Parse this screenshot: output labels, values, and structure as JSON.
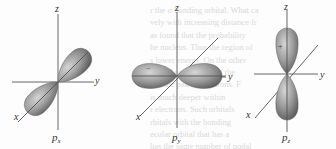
{
  "figure": {
    "orbitals": [
      {
        "name": "px",
        "label_main": "p",
        "label_sub": "x",
        "axes": [
          "z",
          "y",
          "x"
        ],
        "lobe_axis": "x"
      },
      {
        "name": "py",
        "label_main": "p",
        "label_sub": "y",
        "axes": [
          "z",
          "y",
          "x"
        ],
        "lobe_axis": "y",
        "sign_mark": "−"
      },
      {
        "name": "pz",
        "label_main": "p",
        "label_sub": "z",
        "axes": [
          "z",
          "y",
          "x"
        ],
        "lobe_axis": "z",
        "sign_mark": "+",
        "extra_left_axis_label": "y"
      }
    ],
    "colors": {
      "lobe_light": "#c8c8c8",
      "lobe_dark": "#6a6a6a",
      "axis": "#555555",
      "label": "#333333",
      "bleed_text": "#d9d9d9"
    }
  },
  "bleed_through_text": [
    "r the σ bonding orbital. What ca",
    "vely with increasing distance fr",
    "as found that the probability",
    "he nucleus. Thus the region of",
    "s lower energy. On the other",
    "s bond on one side of the",
    "r of the pair of electrons. F",
    "is much deeper within",
    "r electrons. Such orbitals",
    "rbitals with the bonding",
    "ecular orbital that has a",
    "has the same number of nodal"
  ]
}
